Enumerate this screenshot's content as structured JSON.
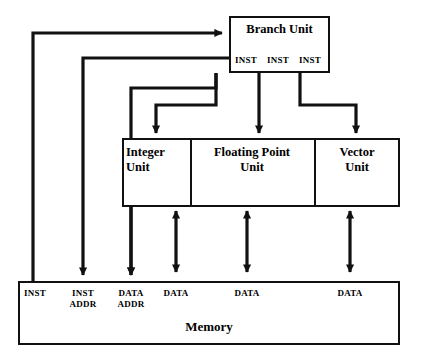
{
  "diagram": {
    "type": "block-diagram",
    "background_color": "#ffffff",
    "line_color": "#111111"
  },
  "branch_unit": {
    "label": "Branch Unit",
    "ports": [
      {
        "label": "INST"
      },
      {
        "label": "INST"
      },
      {
        "label": "INST"
      }
    ]
  },
  "execution_units": [
    {
      "label": "Integer\nUnit"
    },
    {
      "label": "Floating Point\nUnit"
    },
    {
      "label": "Vector\nUnit"
    }
  ],
  "memory": {
    "label": "Memory",
    "ports": [
      {
        "label": "INST"
      },
      {
        "label": "INST\nADDR"
      },
      {
        "label": "DATA\nADDR"
      },
      {
        "label": "DATA"
      },
      {
        "label": "DATA"
      },
      {
        "label": "DATA"
      }
    ]
  }
}
